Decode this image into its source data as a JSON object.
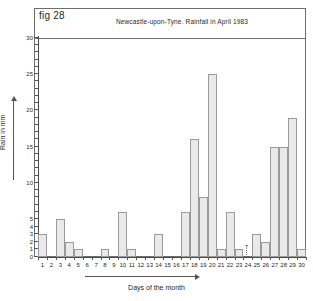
{
  "figure": {
    "fig_label": "fig 28",
    "title": "Newcastle-upon-Tyne. Rainfall in April 1983",
    "xlabel": "Days of the month",
    "ylabel": "Rain in mm",
    "trace_marker": "T"
  },
  "chart_data": {
    "type": "bar",
    "title": "Newcastle-upon-Tyne. Rainfall in April 1983",
    "xlabel": "Days of the month",
    "ylabel": "Rain in mm",
    "categories": [
      1,
      2,
      3,
      4,
      5,
      6,
      7,
      8,
      9,
      10,
      11,
      12,
      13,
      14,
      15,
      16,
      17,
      18,
      19,
      20,
      21,
      22,
      23,
      24,
      25,
      26,
      27,
      28,
      29,
      30
    ],
    "values": [
      3,
      0,
      5,
      2,
      1,
      0,
      0,
      1,
      0,
      6,
      1,
      0,
      0,
      3,
      0,
      0,
      6,
      16,
      8,
      25,
      1,
      6,
      1,
      0,
      3,
      2,
      15,
      15,
      19,
      1
    ],
    "ylim": [
      0,
      30
    ],
    "ytick_labels": [
      "0",
      "1",
      "2",
      "3",
      "4",
      "5",
      "10",
      "15",
      "20",
      "25",
      "30"
    ],
    "ytick_values": [
      0,
      1,
      2,
      3,
      4,
      5,
      10,
      15,
      20,
      25,
      30
    ],
    "grid": false,
    "legend": "none"
  },
  "axes": {
    "y_ticks": [
      {
        "label": "0",
        "value": 0,
        "major": true
      },
      {
        "label": "1",
        "value": 1,
        "major": true
      },
      {
        "label": "2",
        "value": 2,
        "major": true
      },
      {
        "label": "3",
        "value": 3,
        "major": true
      },
      {
        "label": "4",
        "value": 4,
        "major": true
      },
      {
        "label": "5",
        "value": 5,
        "major": true
      },
      {
        "label": "10",
        "value": 10,
        "major": true
      },
      {
        "label": "15",
        "value": 15,
        "major": true
      },
      {
        "label": "20",
        "value": 20,
        "major": true
      },
      {
        "label": "25",
        "value": 25,
        "major": true
      },
      {
        "label": "30",
        "value": 30,
        "major": true
      }
    ]
  },
  "colors": {
    "bar_fill": "#e9e9e9",
    "bar_stroke": "#9a9a9a",
    "axis": "#4a4a4a",
    "frame": "#6e6e6e",
    "text": "#1f1f1f",
    "background": "#ffffff"
  }
}
